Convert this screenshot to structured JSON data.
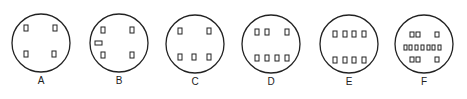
{
  "diagram": {
    "stroke_color": "#222222",
    "background": "#ffffff",
    "circles": [
      {
        "label": "A",
        "cx": 41,
        "cy": 43,
        "r": 29,
        "pins": [
          {
            "x": 24,
            "y": 25,
            "w": 4,
            "h": 6
          },
          {
            "x": 53,
            "y": 25,
            "w": 4,
            "h": 6
          },
          {
            "x": 24,
            "y": 51,
            "w": 4,
            "h": 6
          },
          {
            "x": 52,
            "y": 51,
            "w": 4,
            "h": 6
          }
        ]
      },
      {
        "label": "B",
        "cx": 119,
        "cy": 43,
        "r": 29,
        "pins": [
          {
            "x": 101,
            "y": 27,
            "w": 4,
            "h": 6
          },
          {
            "x": 130,
            "y": 27,
            "w": 4,
            "h": 6
          },
          {
            "x": 95,
            "y": 41,
            "w": 7,
            "h": 4
          },
          {
            "x": 101,
            "y": 52,
            "w": 4,
            "h": 6
          },
          {
            "x": 130,
            "y": 52,
            "w": 4,
            "h": 6
          }
        ]
      },
      {
        "label": "C",
        "cx": 195,
        "cy": 44,
        "r": 29,
        "pins": [
          {
            "x": 178,
            "y": 28,
            "w": 4,
            "h": 6
          },
          {
            "x": 207,
            "y": 28,
            "w": 4,
            "h": 6
          },
          {
            "x": 178,
            "y": 54,
            "w": 4,
            "h": 6
          },
          {
            "x": 192,
            "y": 54,
            "w": 4,
            "h": 6
          },
          {
            "x": 207,
            "y": 54,
            "w": 4,
            "h": 6
          }
        ]
      },
      {
        "label": "D",
        "cx": 271,
        "cy": 44,
        "r": 29,
        "pins": [
          {
            "x": 255,
            "y": 29,
            "w": 4,
            "h": 6
          },
          {
            "x": 265,
            "y": 29,
            "w": 4,
            "h": 6
          },
          {
            "x": 285,
            "y": 29,
            "w": 4,
            "h": 6
          },
          {
            "x": 255,
            "y": 55,
            "w": 4,
            "h": 6
          },
          {
            "x": 265,
            "y": 55,
            "w": 4,
            "h": 6
          },
          {
            "x": 275,
            "y": 55,
            "w": 4,
            "h": 6
          },
          {
            "x": 285,
            "y": 55,
            "w": 4,
            "h": 6
          }
        ]
      },
      {
        "label": "E",
        "cx": 349,
        "cy": 44,
        "r": 29,
        "pins": [
          {
            "x": 333,
            "y": 31,
            "w": 4,
            "h": 6
          },
          {
            "x": 343,
            "y": 31,
            "w": 4,
            "h": 6
          },
          {
            "x": 352,
            "y": 31,
            "w": 4,
            "h": 6
          },
          {
            "x": 362,
            "y": 31,
            "w": 4,
            "h": 6
          },
          {
            "x": 333,
            "y": 57,
            "w": 4,
            "h": 6
          },
          {
            "x": 343,
            "y": 57,
            "w": 4,
            "h": 6
          },
          {
            "x": 352,
            "y": 57,
            "w": 4,
            "h": 6
          },
          {
            "x": 362,
            "y": 57,
            "w": 4,
            "h": 6
          }
        ]
      },
      {
        "label": "F",
        "cx": 424,
        "cy": 44,
        "r": 29,
        "pins": [
          {
            "x": 410,
            "y": 32,
            "w": 4,
            "h": 5
          },
          {
            "x": 416,
            "y": 32,
            "w": 4,
            "h": 5
          },
          {
            "x": 435,
            "y": 32,
            "w": 4,
            "h": 5
          },
          {
            "x": 404,
            "y": 45,
            "w": 3,
            "h": 5
          },
          {
            "x": 409,
            "y": 45,
            "w": 3,
            "h": 5
          },
          {
            "x": 415,
            "y": 45,
            "w": 3,
            "h": 5
          },
          {
            "x": 421,
            "y": 45,
            "w": 3,
            "h": 5
          },
          {
            "x": 427,
            "y": 45,
            "w": 3,
            "h": 5
          },
          {
            "x": 432,
            "y": 45,
            "w": 3,
            "h": 5
          },
          {
            "x": 438,
            "y": 45,
            "w": 3,
            "h": 5
          },
          {
            "x": 410,
            "y": 57,
            "w": 4,
            "h": 5
          },
          {
            "x": 416,
            "y": 57,
            "w": 4,
            "h": 5
          },
          {
            "x": 435,
            "y": 57,
            "w": 4,
            "h": 5
          }
        ]
      }
    ]
  }
}
